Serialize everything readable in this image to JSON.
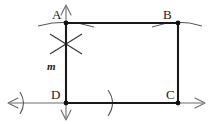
{
  "figure": {
    "type": "geometry-construction-diagram",
    "stroke_color": "#1a1a1a",
    "light_stroke_color": "#6b6b6b",
    "background_color": "#ffffff"
  },
  "labels": {
    "A": "A",
    "B": "B",
    "C": "C",
    "D": "D",
    "m": "m"
  },
  "points": {
    "A": {
      "x": 66,
      "y": 23
    },
    "B": {
      "x": 178,
      "y": 23
    },
    "C": {
      "x": 178,
      "y": 103
    },
    "D": {
      "x": 66,
      "y": 103
    }
  },
  "segments": [
    {
      "name": "top-side-AB",
      "x1": 66,
      "y1": 23,
      "x2": 178,
      "y2": 23
    },
    {
      "name": "left-side-AD",
      "x1": 66,
      "y1": 23,
      "x2": 66,
      "y2": 103
    },
    {
      "name": "right-side-BC",
      "x1": 178,
      "y1": 23,
      "x2": 178,
      "y2": 103
    },
    {
      "name": "bottom-side-DC",
      "x1": 66,
      "y1": 103,
      "x2": 178,
      "y2": 103
    }
  ],
  "rays": {
    "vertical_line_m": {
      "top_y": 5,
      "bottom_y": 120,
      "x": 66
    },
    "horizontal_line": {
      "left_x": 8,
      "right_x": 205,
      "y": 103
    }
  },
  "construction_marks": {
    "arc_through_A": "shallow arc crossing vertical line at A",
    "arc_through_B": "shallow arc crossing vertical line at B",
    "x_cross_below_A": "two intersecting construction arcs forming an X",
    "tick_left_of_D": "arc tick mark on horizontal line left of D",
    "tick_right_of_D": "arc tick mark on bottom segment between D and C"
  }
}
